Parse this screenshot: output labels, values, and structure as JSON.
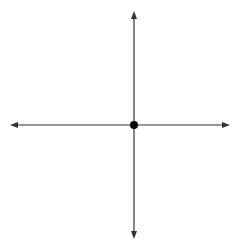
{
  "diagram": {
    "type": "coordinate-plane",
    "grid": {
      "x_min": -8,
      "x_max": 6,
      "y_min": -7,
      "y_max": 7,
      "spacing_units": 1
    },
    "axes": {
      "x_label": "x",
      "y_label": "y",
      "origin_label": "0"
    },
    "triangle": {
      "fill": "#c8c8c8",
      "stroke": "#444444",
      "vertices": [
        {
          "name": "A",
          "x": -6,
          "y": 0
        },
        {
          "name": "B",
          "x": -6,
          "y": 4
        },
        {
          "name": "C",
          "x": 0,
          "y": 0
        }
      ]
    },
    "point_C": {
      "label": "C",
      "marker": "filled-dot"
    }
  }
}
